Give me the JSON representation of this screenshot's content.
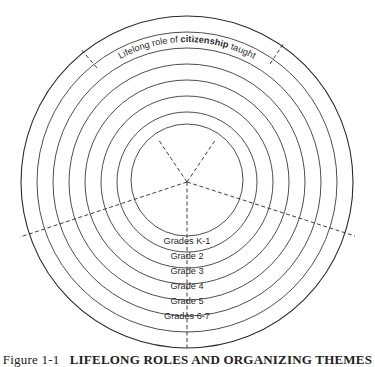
{
  "caption": {
    "figure_number": "Figure 1-1",
    "title": "LIFELONG ROLES AND ORGANIZING THEMES"
  },
  "roles": {
    "citizenship": {
      "prefix": "Lifelong role of ",
      "role": "citizenship",
      "suffix": " taught",
      "line2": "through organizing themes"
    },
    "family": {
      "prefix": "Lifelong role of ",
      "role": "family membership",
      "line1_before": "Lifelong role of ",
      "line2": "taught through organizing themes"
    },
    "efficacy": {
      "prefix": "Lifelong role of ",
      "role": "personal efficacy",
      "line2": "taught through organizing themes"
    },
    "avocation": {
      "prefix": "Lifelong role of ",
      "role": "avocation",
      "line2": "taught through organizing themes"
    },
    "occupation": {
      "prefix": "Lifelong role of ",
      "role": "occupation",
      "suffix": " taught",
      "line2": "through organizing themes"
    }
  },
  "themes": [
    "Western hemisphere—Eastern hemisphere—World regional geography—Ancient civilizations",
    "United States history and geography",
    "The home state—United States regional geography—climatic zones",
    "Local communities—communities in other nations",
    "Neighborhood—occupations",
    "Self—family school"
  ],
  "grades": [
    "Grades K-1",
    "Grade 2",
    "Grade 3",
    "Grade 4",
    "Grade 5",
    "Grades 6-7"
  ]
}
